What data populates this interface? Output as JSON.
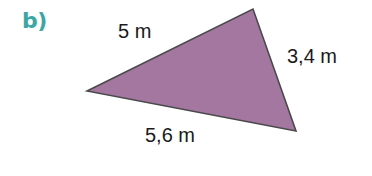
{
  "figure": {
    "part_label": "b)",
    "shape": "triangle",
    "sides": {
      "top_left": {
        "label": "5 m",
        "length": 5,
        "unit": "m"
      },
      "right": {
        "label": "3,4 m",
        "length": 3.4,
        "unit": "m"
      },
      "bottom": {
        "label": "5,6 m",
        "length": 5.6,
        "unit": "m"
      }
    },
    "vertices": {
      "left": [
        87,
        91
      ],
      "top": [
        253,
        9
      ],
      "bottom_right": [
        296,
        131
      ]
    },
    "colors": {
      "part_label": "#3aa6a6",
      "fill": "#a477a0",
      "stroke": "#4a4a4a",
      "text": "#1a1a1a"
    }
  }
}
